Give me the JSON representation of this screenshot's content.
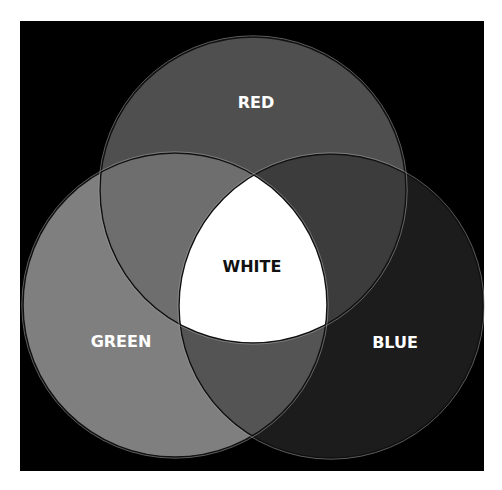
{
  "diagram": {
    "type": "venn",
    "background": "#000000",
    "frame": {
      "x": 20,
      "y": 21,
      "width": 464,
      "height": 450
    },
    "sets": [
      {
        "id": "red",
        "label": "RED",
        "cx": 253,
        "cy": 190,
        "r": 153,
        "fill": "#4f4f4f",
        "label_x": 256,
        "label_y": 108,
        "label_color": "#ffffff"
      },
      {
        "id": "green",
        "label": "GREEN",
        "cx": 175,
        "cy": 305,
        "r": 152,
        "fill": "#7f7f7f",
        "label_x": 121,
        "label_y": 347,
        "label_color": "#ffffff"
      },
      {
        "id": "blue",
        "label": "BLUE",
        "cx": 331,
        "cy": 306,
        "r": 152,
        "fill": "#1c1c1c",
        "label_x": 395,
        "label_y": 348,
        "label_color": "#ffffff"
      }
    ],
    "intersections": [
      {
        "sets": [
          "red",
          "green"
        ],
        "fill": "#6e6e6e"
      },
      {
        "sets": [
          "red",
          "blue"
        ],
        "fill": "#3c3c3c"
      },
      {
        "sets": [
          "green",
          "blue"
        ],
        "fill": "#545454"
      },
      {
        "sets": [
          "red",
          "green",
          "blue"
        ],
        "fill": "#ffffff",
        "label": "WHITE",
        "label_x": 252,
        "label_y": 272,
        "label_color": "#111111"
      }
    ]
  }
}
